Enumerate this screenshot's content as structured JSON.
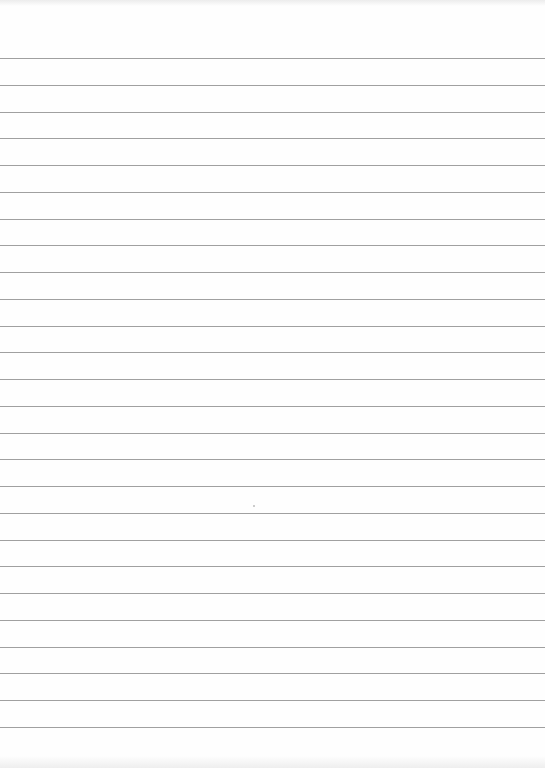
{
  "paper": {
    "type": "lined-paper",
    "background_color": "#fefefe",
    "rule_color": "#8f8f8f",
    "rule_count": 26,
    "first_rule_y": 58,
    "rule_spacing": 26.76
  }
}
